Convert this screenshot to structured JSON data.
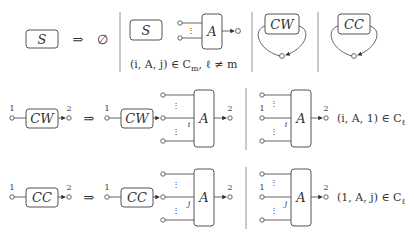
{
  "row1": {
    "lhs_box": "S",
    "arrow": "⇒",
    "rhs": "∅",
    "panel1": {
      "box_s": "S",
      "box_a": "A",
      "condition": "(i, A, j) ∈ C",
      "cond_sub": "m",
      "cond_tail": ", ℓ ≠ m"
    },
    "panel2": {
      "box": "CW"
    },
    "panel3": {
      "box": "CC"
    }
  },
  "row2": {
    "lhs_box": "CW",
    "in_label": "1",
    "out_label": "2",
    "arrow": "⇒",
    "rhs_box": "CW",
    "rhs_in_label": "1",
    "a_box": "A",
    "a_out_label": "2",
    "port_label": "i",
    "panel_a_box": "A",
    "panel_in_label": "1",
    "panel_port_label": "i",
    "panel_out_label": "2",
    "condition": "(i, A, 1) ∈ C",
    "cond_sub": "ℓ"
  },
  "row3": {
    "lhs_box": "CC",
    "in_label": "1",
    "out_label": "2",
    "arrow": "⇒",
    "rhs_box": "CC",
    "rhs_in_label": "1",
    "a_box": "A",
    "a_out_label": "2",
    "port_label": "j",
    "panel_a_box": "A",
    "panel_in_label": "1",
    "panel_port_label": "j",
    "panel_out_label": "2",
    "condition": "(1, A, j) ∈ C",
    "cond_sub": "ℓ"
  },
  "vdots": "⋮"
}
